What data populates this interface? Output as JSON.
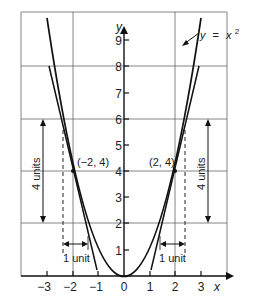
{
  "diagram": {
    "curve_label": "y = x²",
    "curve_label_parts": {
      "y": "y",
      "eq": "=",
      "x": "x",
      "exp": "2"
    },
    "axis_labels": {
      "x": "x",
      "y": "y"
    },
    "x_ticks": [
      "−3",
      "−2",
      "−1",
      "0",
      "1",
      "2",
      "3"
    ],
    "y_ticks": [
      "1",
      "2",
      "3",
      "4",
      "5",
      "6",
      "7",
      "8",
      "9"
    ],
    "points": [
      {
        "label": "(−2, 4)",
        "x": -2,
        "y": 4
      },
      {
        "label": "(2, 4)",
        "x": 2,
        "y": 4
      }
    ],
    "annotations": {
      "left_vertical": "4 units",
      "right_vertical": "4 units",
      "left_horizontal": "1 unit",
      "right_horizontal": "1 unit"
    },
    "tangent_lines": [
      {
        "at_point": "(−2, 4)",
        "slope": -4
      },
      {
        "at_point": "(2, 4)",
        "slope": 4
      }
    ],
    "colors": {
      "line": "#1a1a1a",
      "grid": "#555555",
      "background": "#ffffff"
    }
  }
}
